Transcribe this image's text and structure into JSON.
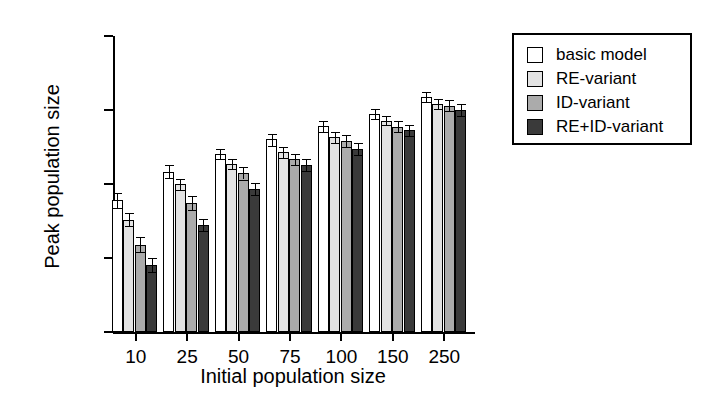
{
  "chart_data": {
    "type": "bar",
    "title": "",
    "xlabel": "Initial population size",
    "ylabel": "Peak population size",
    "yscale": "log",
    "ylim": [
      1,
      10000
    ],
    "ytick_labels": [
      "10000",
      "1000",
      "100",
      "10",
      "1"
    ],
    "ytick_values": [
      10000,
      1000,
      100,
      10,
      1
    ],
    "grid": false,
    "legend_position": "right-top",
    "categories": [
      "10",
      "25",
      "50",
      "75",
      "100",
      "150",
      "250"
    ],
    "series": [
      {
        "name": "basic model",
        "color": "#ffffff",
        "values": [
          60,
          145,
          255,
          400,
          600,
          880,
          1500
        ],
        "err_low": [
          48,
          120,
          215,
          330,
          500,
          760,
          1300
        ],
        "err_high": [
          76,
          178,
          300,
          480,
          720,
          1020,
          1750
        ]
      },
      {
        "name": "RE-variant",
        "color": "#e3e3e3",
        "values": [
          33,
          100,
          185,
          270,
          430,
          720,
          1200
        ],
        "err_low": [
          27,
          84,
          158,
          228,
          360,
          620,
          1020
        ],
        "err_high": [
          40,
          118,
          215,
          318,
          510,
          840,
          1400
        ]
      },
      {
        "name": "ID-variant",
        "color": "#ababab",
        "values": [
          15,
          55,
          140,
          215,
          385,
          590,
          1150
        ],
        "err_low": [
          12,
          44,
          115,
          178,
          320,
          500,
          960
        ],
        "err_high": [
          19,
          68,
          168,
          258,
          460,
          700,
          1370
        ]
      },
      {
        "name": "RE+ID-variant",
        "color": "#3a3a3a",
        "values": [
          8,
          28,
          85,
          180,
          300,
          530,
          1000
        ],
        "err_low": [
          6.5,
          23,
          70,
          148,
          250,
          450,
          830
        ],
        "err_high": [
          10,
          34,
          103,
          218,
          360,
          625,
          1200
        ]
      }
    ]
  },
  "legend": {
    "items": [
      {
        "label": "basic model",
        "swatch": "#ffffff"
      },
      {
        "label": "RE-variant",
        "swatch": "#e3e3e3"
      },
      {
        "label": "ID-variant",
        "swatch": "#ababab"
      },
      {
        "label": "RE+ID-variant",
        "swatch": "#3a3a3a"
      }
    ]
  }
}
